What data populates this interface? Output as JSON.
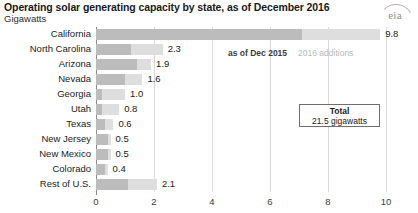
{
  "header": {
    "title": "Operating solar generating capacity by state, as of December 2016",
    "subtitle": "Gigawatts",
    "logo_text": "eia"
  },
  "legend": {
    "base_label": "as of Dec 2015",
    "additions_label": "2016 additions"
  },
  "callout": {
    "title": "Total",
    "value": "21.5 gigawatts"
  },
  "colors": {
    "base_segment": "#bcbcbc",
    "additions_segment": "#dedede",
    "axis": "#8a8a8a",
    "gridline": "#d9d9d9"
  },
  "chart_data": {
    "type": "bar",
    "orientation": "horizontal",
    "title": "Operating solar generating capacity by state, as of December 2016",
    "subtitle": "Gigawatts",
    "xlabel": "",
    "ylabel": "",
    "xlim": [
      0,
      10
    ],
    "xticks": [
      "0",
      "2",
      "4",
      "6",
      "8",
      "10"
    ],
    "xtick_values": [
      0,
      2,
      4,
      6,
      8,
      10
    ],
    "grid": "vertical",
    "legend_position": "top-center",
    "stacked": true,
    "categories": [
      "California",
      "North Carolina",
      "Arizona",
      "Nevada",
      "Georgia",
      "Utah",
      "Texas",
      "New Jersey",
      "New Mexico",
      "Colorado",
      "Rest of U.S."
    ],
    "series": [
      {
        "name": "as of Dec 2015",
        "values": [
          7.1,
          1.2,
          1.4,
          1.0,
          0.2,
          0.2,
          0.3,
          0.4,
          0.4,
          0.3,
          1.1
        ]
      },
      {
        "name": "2016 additions",
        "values": [
          2.7,
          1.1,
          0.5,
          0.6,
          0.8,
          0.6,
          0.3,
          0.1,
          0.1,
          0.1,
          1.0
        ]
      }
    ],
    "values": [
      9.8,
      2.3,
      1.9,
      1.6,
      1.0,
      0.8,
      0.6,
      0.5,
      0.5,
      0.4,
      2.1
    ],
    "value_labels": [
      "9.8",
      "2.3",
      "1.9",
      "1.6",
      "1.0",
      "0.8",
      "0.6",
      "0.5",
      "0.5",
      "0.4",
      "2.1"
    ],
    "annotations": [
      {
        "text": "Total",
        "value": "21.5 gigawatts"
      }
    ]
  }
}
